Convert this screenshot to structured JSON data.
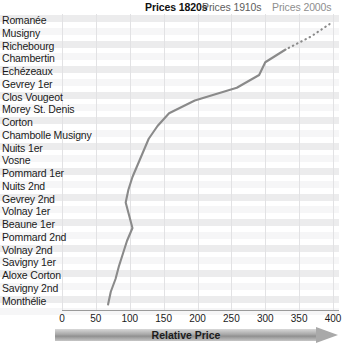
{
  "chart_data": {
    "type": "line",
    "title": "",
    "xlabel": "Relative Price",
    "ylabel": "",
    "orientation": "horizontal-categories-vertical-axis",
    "xlim": [
      0,
      400
    ],
    "xticks": [
      0,
      50,
      100,
      150,
      200,
      250,
      300,
      350,
      400
    ],
    "grid": true,
    "legend_position": "top",
    "categories": [
      "Romanée",
      "Musigny",
      "Richebourg",
      "Chambertin",
      "Echézeaux",
      "Gevrey 1er",
      "Clos Vougeot",
      "Morey St. Denis",
      "Corton",
      "Chambolle Musigny",
      "Nuits 1er",
      "Vosne",
      "Pommard 1er",
      "Nuits 2nd",
      "Gevrey 2nd",
      "Volnay 1er",
      "Beaune 1er",
      "Pommard 2nd",
      "Volnay 2nd",
      "Savigny 1er",
      "Aloxe Corton",
      "Savigny 2nd",
      "Monthélie"
    ],
    "series": [
      {
        "name": "Prices 1820s",
        "color": "#141414",
        "style": "solid",
        "values": [
          184,
          157,
          174,
          136,
          128,
          110,
          97,
          75,
          89,
          83,
          92,
          80,
          72,
          86,
          91,
          83,
          74,
          68,
          62,
          55,
          48,
          41,
          38
        ]
      },
      {
        "name": "Prices 1910s",
        "color": "#4d4d4d",
        "style": "solid",
        "values": [
          219,
          190,
          205,
          163,
          146,
          131,
          112,
          104,
          88,
          96,
          105,
          98,
          86,
          90,
          103,
          119,
          126,
          112,
          100,
          92,
          84,
          73,
          66
        ]
      },
      {
        "name": "Prices 2000s",
        "color": "#8a8a8a",
        "style": "solid-then-dotted",
        "dotted_from_index": 2,
        "values": [
          395,
          367,
          330,
          300,
          291,
          258,
          196,
          158,
          141,
          128,
          120,
          112,
          104,
          98,
          94,
          99,
          104,
          96,
          90,
          84,
          79,
          72,
          68
        ]
      }
    ]
  },
  "axis": {
    "tick_labels": [
      "0",
      "50",
      "100",
      "150",
      "200",
      "250",
      "300",
      "350",
      "400"
    ],
    "axis_title": "Relative Price"
  },
  "legend": {
    "items": [
      {
        "label": "Prices 1820s"
      },
      {
        "label": "Prices 1910s"
      },
      {
        "label": "Prices 2000s"
      }
    ]
  }
}
